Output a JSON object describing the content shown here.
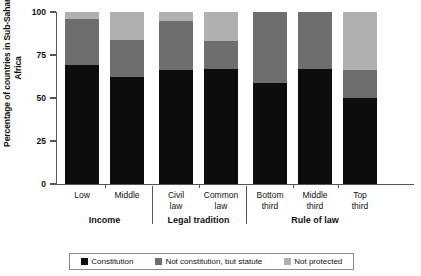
{
  "chart_data": {
    "type": "bar",
    "subtype": "stacked-bar-100",
    "title": "",
    "xlabel": "",
    "ylabel": "Percentage of countries in Sub-Saharan Africa",
    "ylim": [
      0,
      100
    ],
    "yticks": [
      0,
      25,
      50,
      75,
      100
    ],
    "ytick_labels": [
      "0",
      "25",
      "50",
      "75",
      "100"
    ],
    "grid": false,
    "legend_position": "bottom",
    "categories": [
      "Low",
      "Middle",
      "Civil law",
      "Common law",
      "Bottom third",
      "Middle third",
      "Top third"
    ],
    "category_lines": [
      [
        "Low"
      ],
      [
        "Middle"
      ],
      [
        "Civil",
        "law"
      ],
      [
        "Common",
        "law"
      ],
      [
        "Bottom",
        "third"
      ],
      [
        "Middle",
        "third"
      ],
      [
        "Top",
        "third"
      ]
    ],
    "groups": [
      {
        "label": "Income",
        "categories": [
          "Low",
          "Middle"
        ]
      },
      {
        "label": "Legal tradition",
        "categories": [
          "Civil law",
          "Common law"
        ]
      },
      {
        "label": "Rule of law",
        "categories": [
          "Bottom third",
          "Middle third",
          "Top third"
        ]
      }
    ],
    "series": [
      {
        "name": "Constitution",
        "color": "#0d0d0d",
        "values": [
          69,
          62,
          66,
          67,
          59,
          67,
          50
        ]
      },
      {
        "name": "Not constitution, but statute",
        "color": "#6e6e6e",
        "values": [
          27,
          22,
          29,
          16,
          41,
          33,
          16
        ]
      },
      {
        "name": "Not protected",
        "color": "#b0b0b0",
        "values": [
          4,
          16,
          5,
          17,
          0,
          0,
          34
        ]
      }
    ]
  },
  "legend": {
    "items": [
      {
        "label": "Constitution",
        "swatch": "dark-swatch-icon"
      },
      {
        "label": "Not constitution, but statute",
        "swatch": "mid-swatch-icon"
      },
      {
        "label": "Not protected",
        "swatch": "light-swatch-icon"
      }
    ]
  }
}
